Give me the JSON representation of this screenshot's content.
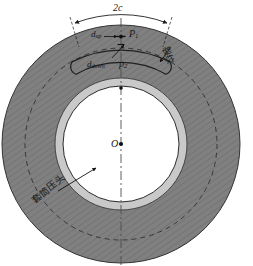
{
  "figure": {
    "background_color": "#ffffff",
    "colors": {
      "outer_annulus_fill": "#808080",
      "hatch_line": "#6e6e6e",
      "inner_ring_fill": "#c9c9c9",
      "bore_fill": "#ffffff",
      "outline": "#2b2b2b",
      "dashed_line": "#3a3a3a",
      "centerline": "#555555",
      "label_text": "#151515"
    },
    "geometry": {
      "center_x": 121,
      "center_y": 144,
      "outer_radius": 119,
      "dashed_circle_radius": 96,
      "ring_outer_radius": 66,
      "bore_radius": 58,
      "slot_center_angle_deg": 270,
      "slot_half_span_deg": 27,
      "slot_mid_radius": 100,
      "slot_half_width": 8
    },
    "labels": {
      "span_dimension": "2c",
      "depth_up": "d",
      "depth_up_sub": "up",
      "point_upper": "P1",
      "point_upper_base": "P",
      "point_upper_sub": "1",
      "depth_down": "d",
      "depth_down_sub": "down",
      "point_lower": "P2",
      "point_lower_base": "p",
      "point_lower_sub": "2",
      "center_point": "O",
      "annotation_right": "裂纹",
      "annotation_left": "套筒压头"
    },
    "markers": {
      "center_dot": "center-dot",
      "point_upper_dot": "upper-point-dot",
      "point_lower_dot": "lower-point-dot"
    },
    "lines": {
      "vertical_centerline_style": "dash-dot",
      "dashed_circle_style": "dashed",
      "hatch_pattern": "diagonal-fine-lines"
    }
  }
}
